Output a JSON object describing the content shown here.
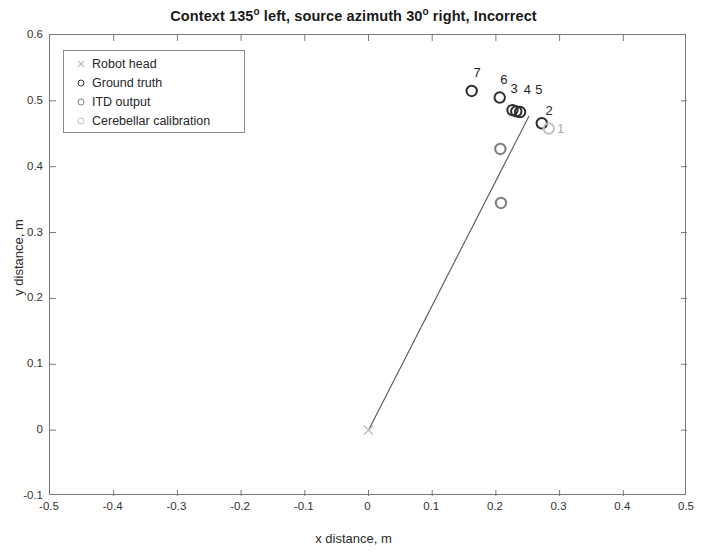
{
  "chart_data": {
    "type": "scatter",
    "title_parts": {
      "seg1": "Context 135",
      "deg1": "o",
      "seg2": " left, source azimuth 30",
      "deg2": "o",
      "seg3": " right, Incorrect"
    },
    "xlabel": "x distance, m",
    "ylabel": "y distance, m",
    "xlim": [
      -0.5,
      0.5
    ],
    "ylim": [
      -0.1,
      0.6
    ],
    "xticks": [
      -0.5,
      -0.4,
      -0.3,
      -0.2,
      -0.1,
      0,
      0.1,
      0.2,
      0.3,
      0.4,
      0.5
    ],
    "xticklabels": [
      "-0.5",
      "-0.4",
      "-0.3",
      "-0.2",
      "-0.1",
      "0",
      "0.1",
      "0.2",
      "0.3",
      "0.4",
      "0.5"
    ],
    "yticks": [
      -0.1,
      0,
      0.1,
      0.2,
      0.3,
      0.4,
      0.5,
      0.6
    ],
    "yticklabels": [
      "-0.1",
      "0",
      "0.1",
      "0.2",
      "0.3",
      "0.4",
      "0.5",
      "0.6"
    ],
    "grid": false,
    "legend_position": "upper left",
    "legend": [
      {
        "label": "Robot head",
        "marker": "x",
        "color": "#b5b5b5"
      },
      {
        "label": "Ground truth",
        "marker": "o",
        "color": "#3a3a3a"
      },
      {
        "label": "ITD output",
        "marker": "o",
        "color": "#808080"
      },
      {
        "label": "Cerebellar calibration",
        "marker": "o",
        "color": "#c0c0c0"
      }
    ],
    "series": [
      {
        "name": "Robot head",
        "marker": "x",
        "color": "#b5b5b5",
        "points": [
          {
            "x": 0.0,
            "y": 0.0
          }
        ]
      },
      {
        "name": "Ground truth",
        "marker": "o",
        "color": "#2e2e2e",
        "points": [
          {
            "x": 0.162,
            "y": 0.515,
            "label": "7"
          },
          {
            "x": 0.206,
            "y": 0.505,
            "label": "6"
          },
          {
            "x": 0.226,
            "y": 0.486,
            "label": "3"
          },
          {
            "x": 0.232,
            "y": 0.484,
            "label": "4"
          },
          {
            "x": 0.238,
            "y": 0.483,
            "label": "5"
          },
          {
            "x": 0.272,
            "y": 0.466,
            "label": "2"
          }
        ]
      },
      {
        "name": "ITD output",
        "marker": "o",
        "color": "#7d7d7d",
        "points": [
          {
            "x": 0.207,
            "y": 0.427
          },
          {
            "x": 0.208,
            "y": 0.345
          }
        ]
      },
      {
        "name": "Cerebellar calibration",
        "marker": "o",
        "color": "#c2c2c2",
        "points": [
          {
            "x": 0.283,
            "y": 0.458,
            "label": "1"
          }
        ]
      }
    ],
    "lines": [
      {
        "name": "gaze-ray",
        "color": "#555555",
        "from": {
          "x": 0.0,
          "y": 0.0
        },
        "to": {
          "x": 0.252,
          "y": 0.477
        }
      }
    ],
    "point_labels": [
      {
        "text": "7",
        "x": 0.172,
        "y": 0.542,
        "faint": false
      },
      {
        "text": "6",
        "x": 0.214,
        "y": 0.532,
        "faint": false
      },
      {
        "text": "3",
        "x": 0.23,
        "y": 0.518,
        "faint": false
      },
      {
        "text": "4",
        "x": 0.251,
        "y": 0.517,
        "faint": false
      },
      {
        "text": "5",
        "x": 0.269,
        "y": 0.517,
        "faint": false
      },
      {
        "text": "2",
        "x": 0.285,
        "y": 0.484,
        "faint": false
      },
      {
        "text": "1",
        "x": 0.303,
        "y": 0.457,
        "faint": true
      }
    ]
  }
}
